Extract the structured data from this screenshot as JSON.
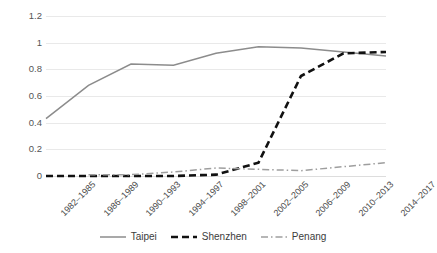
{
  "chart_data": {
    "type": "line",
    "title": "",
    "subtitle": "",
    "xlabel": "",
    "ylabel": "",
    "ylim": [
      0,
      1.2
    ],
    "yticks": [
      "0",
      "0.2",
      "0.4",
      "0.6",
      "0.8",
      "1",
      "1.2"
    ],
    "ytick_values": [
      0,
      0.2,
      0.4,
      0.6,
      0.8,
      1,
      1.2
    ],
    "grid": "horizontal",
    "legend_position": "bottom",
    "categories": [
      "1982–1985",
      "1986–1989",
      "1990–1993",
      "1994–1997",
      "1998–2001",
      "2002–2005",
      "2006–2009",
      "2010–2013",
      "2014–2017"
    ],
    "series": [
      {
        "name": "Taipei",
        "color": "#8c8c8c",
        "style": "solid",
        "values": [
          0.43,
          0.68,
          0.84,
          0.83,
          0.92,
          0.97,
          0.96,
          0.93,
          0.9
        ]
      },
      {
        "name": "Shenzhen",
        "color": "#111111",
        "style": "dashed",
        "values": [
          0.0,
          0.0,
          0.0,
          0.0,
          0.01,
          0.1,
          0.75,
          0.92,
          0.93
        ]
      },
      {
        "name": "Penang",
        "color": "#9e9e9e",
        "style": "dashdot",
        "values": [
          null,
          0.01,
          0.01,
          0.03,
          0.06,
          0.05,
          0.04,
          0.07,
          0.1
        ]
      }
    ]
  },
  "legend": {
    "items": [
      {
        "label": "Taipei"
      },
      {
        "label": "Shenzhen"
      },
      {
        "label": "Penang"
      }
    ]
  }
}
